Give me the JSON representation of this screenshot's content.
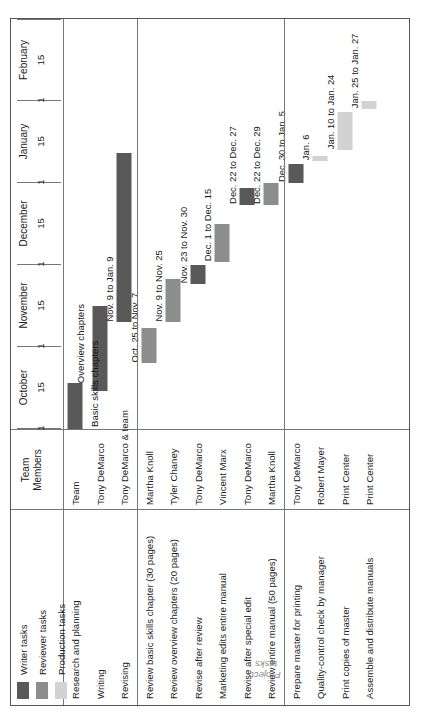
{
  "chart_title": "Writing/Review Schedule: Software User's Manual",
  "axis_caption": "Project\ntasks",
  "axis_caption_line1": "Project",
  "axis_caption_line2": "tasks",
  "columns": {
    "team_header_line1": "Team",
    "team_header_line2": "Members"
  },
  "legend": {
    "items": [
      {
        "label": "Writer tasks",
        "color": "#595959"
      },
      {
        "label": "Reviewer tasks",
        "color": "#8d8d8d"
      },
      {
        "label": "Production tasks",
        "color": "#d2d2d2"
      }
    ]
  },
  "phase_captions": [
    {
      "text": "Basic skills chapters"
    },
    {
      "text": "Overview chapters"
    }
  ],
  "chart_data": {
    "type": "bar",
    "chart_subtype": "gantt",
    "title": "Writing/Review Schedule: Software User's Manual",
    "xlabel": "",
    "ylabel": "Project tasks",
    "grid": true,
    "legend_position": "top-left",
    "axis_months": [
      "October",
      "November",
      "December",
      "January",
      "February"
    ],
    "axis_ticks_per_month": [
      "1",
      "15"
    ],
    "axis_range_days": [
      0,
      150
    ],
    "categories": [
      "Research and planning",
      "Writing",
      "Revising",
      "Review basic skills chapter (30 pages)",
      "Review overview chapters (20 pages)",
      "Revise after review",
      "Marketing edits entire manual",
      "Revise after special edit",
      "Review entire manual (50 pages)",
      "Prepare master for printing",
      "Quality-control check by manager",
      "Print copies of master",
      "Assemble and distribute manuals"
    ],
    "team_members": [
      "Team",
      "Tony DeMarco",
      "Tony DeMarco & team",
      "Martha Knoll",
      "Tyler Chaney",
      "Tony DeMarco",
      "Vincent Marx",
      "Tony DeMarco",
      "Martha Knoll",
      "Tony DeMarco",
      "Robert Mayer",
      "Print Center",
      "Print Center"
    ],
    "series": [
      {
        "name": "Writer tasks",
        "color": "#595959",
        "tasks": [
          {
            "task": "Research and planning",
            "label": "",
            "start_day": 0,
            "end_day": 17
          },
          {
            "task": "Writing",
            "label": "",
            "start_day": 14,
            "end_day": 45
          },
          {
            "task": "Revising",
            "label": "Nov. 9 to Jan. 9",
            "start_day": 39,
            "end_day": 101
          },
          {
            "task": "Revise after review",
            "label": "Nov. 23 to Nov. 30",
            "start_day": 53,
            "end_day": 60
          },
          {
            "task": "Revise after special edit",
            "label": "Dec. 22 to Dec. 27",
            "start_day": 82,
            "end_day": 88
          },
          {
            "task": "Prepare master for printing",
            "label": "Dec. 30 to Jan. 5",
            "start_day": 90,
            "end_day": 97
          }
        ]
      },
      {
        "name": "Reviewer tasks",
        "color": "#8d8d8d",
        "tasks": [
          {
            "task": "Review basic skills chapter (30 pages)",
            "label": "Oct. 25 to Nov. 7",
            "start_day": 24,
            "end_day": 37
          },
          {
            "task": "Review overview chapters (20 pages)",
            "label": "Nov. 9 to Nov. 25",
            "start_day": 39,
            "end_day": 55
          },
          {
            "task": "Marketing edits entire manual",
            "label": "Dec. 1 to Dec. 15",
            "start_day": 61,
            "end_day": 75
          },
          {
            "task": "Review entire manual (50 pages)",
            "label": "Dec. 22 to Dec. 29",
            "start_day": 82,
            "end_day": 90
          }
        ]
      },
      {
        "name": "Production tasks",
        "color": "#d2d2d2",
        "tasks": [
          {
            "task": "Quality-control check by manager",
            "label": "Jan. 6",
            "start_day": 98,
            "end_day": 100
          },
          {
            "task": "Print copies of master",
            "label": "Jan. 10 to Jan. 24",
            "start_day": 102,
            "end_day": 116
          },
          {
            "task": "Assemble and distribute manuals",
            "label": "Jan. 25 to Jan. 27",
            "start_day": 117,
            "end_day": 120
          }
        ]
      }
    ],
    "rows": [
      {
        "task": "Research and planning",
        "team": "Team",
        "type": "writer",
        "label": "",
        "start_day": 0,
        "end_day": 17,
        "group": 1
      },
      {
        "task": "Writing",
        "team": "Tony DeMarco",
        "type": "writer",
        "label": "",
        "start_day": 14,
        "end_day": 45,
        "group": 1
      },
      {
        "task": "Revising",
        "team": "Tony DeMarco & team",
        "type": "writer",
        "label": "Nov. 9 to Jan. 9",
        "start_day": 39,
        "end_day": 101,
        "group": 1
      },
      {
        "task": "Review basic skills chapter (30 pages)",
        "team": "Martha Knoll",
        "type": "reviewer",
        "label": "Oct. 25 to Nov. 7",
        "start_day": 24,
        "end_day": 37,
        "group": 2
      },
      {
        "task": "Review overview chapters (20 pages)",
        "team": "Tyler Chaney",
        "type": "reviewer",
        "label": "Nov. 9 to Nov. 25",
        "start_day": 39,
        "end_day": 55,
        "group": 2
      },
      {
        "task": "Revise after review",
        "team": "Tony DeMarco",
        "type": "writer",
        "label": "Nov. 23 to Nov. 30",
        "start_day": 53,
        "end_day": 60,
        "group": 2
      },
      {
        "task": "Marketing edits entire manual",
        "team": "Vincent Marx",
        "type": "reviewer",
        "label": "Dec. 1 to Dec. 15",
        "start_day": 61,
        "end_day": 75,
        "group": 2
      },
      {
        "task": "Revise after special edit",
        "team": "Tony DeMarco",
        "type": "writer",
        "label": "Dec. 22 to Dec. 27",
        "start_day": 82,
        "end_day": 88,
        "group": 2
      },
      {
        "task": "Review entire manual (50 pages)",
        "team": "Martha Knoll",
        "type": "reviewer",
        "label": "Dec. 22 to Dec. 29",
        "start_day": 82,
        "end_day": 90,
        "group": 2
      },
      {
        "task": "Prepare master for printing",
        "team": "Tony DeMarco",
        "type": "writer",
        "label": "Dec. 30 to Jan. 5",
        "start_day": 90,
        "end_day": 97,
        "group": 3
      },
      {
        "task": "Quality-control check by manager",
        "team": "Robert Mayer",
        "type": "production",
        "label": "Jan. 6",
        "start_day": 98,
        "end_day": 100,
        "group": 3
      },
      {
        "task": "Print copies of master",
        "team": "Print Center",
        "type": "production",
        "label": "Jan. 10 to Jan. 24",
        "start_day": 102,
        "end_day": 116,
        "group": 3
      },
      {
        "task": "Assemble and distribute manuals",
        "team": "Print Center",
        "type": "production",
        "label": "Jan. 25 to Jan. 27",
        "start_day": 117,
        "end_day": 120,
        "group": 3
      }
    ]
  }
}
